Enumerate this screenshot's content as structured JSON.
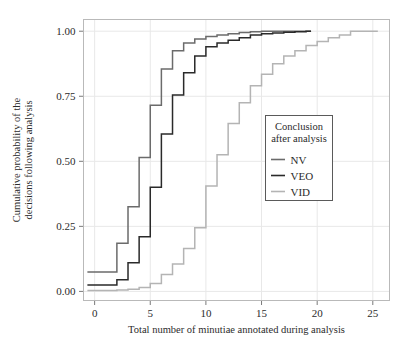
{
  "figure": {
    "name": "cumulative-probability-ecdf-chart",
    "background": "#ffffff"
  },
  "chart_data": {
    "type": "line",
    "subtype": "step-ecdf",
    "title": "",
    "xlabel": "Total number of minutiae annotated during analysis",
    "ylabel": "Cumulative probability of the decisions following analysis",
    "ylabel_line1": "Cumulative probability of the",
    "ylabel_line2": "decisions following analysis",
    "xlim": [
      -1,
      26.5
    ],
    "ylim": [
      -0.035,
      1.045
    ],
    "xticks": [
      0,
      5,
      10,
      15,
      20,
      25
    ],
    "xticklabels": [
      "0",
      "5",
      "10",
      "15",
      "20",
      "25"
    ],
    "yticks": [
      0.0,
      0.25,
      0.5,
      0.75,
      1.0
    ],
    "yticklabels": [
      "0.00",
      "0.25",
      "0.50",
      "0.75",
      "1.00"
    ],
    "grid": true,
    "grid_color": "#e8e8e8",
    "panel_border_color": "#b9b9b9",
    "legend": {
      "title_line1": "Conclusion",
      "title_line2": "after analysis",
      "position": "inside-right-middle",
      "entries": [
        {
          "label": "NV",
          "color": "#6b6b6b"
        },
        {
          "label": "VEO",
          "color": "#2a2a2a"
        },
        {
          "label": "VID",
          "color": "#b4b4b4"
        }
      ]
    },
    "series": [
      {
        "name": "NV",
        "color": "#6b6b6b",
        "x": [
          1,
          2,
          3,
          4,
          5,
          6,
          7,
          8,
          9,
          10,
          11,
          12,
          13,
          14,
          15,
          19
        ],
        "y": [
          0.075,
          0.185,
          0.325,
          0.515,
          0.715,
          0.855,
          0.925,
          0.955,
          0.97,
          0.98,
          0.985,
          0.99,
          0.995,
          0.998,
          1.0,
          1.0
        ]
      },
      {
        "name": "VEO",
        "color": "#2a2a2a",
        "x": [
          1,
          2,
          3,
          4,
          5,
          6,
          7,
          8,
          9,
          10,
          11,
          12,
          13,
          14,
          15,
          16,
          17,
          18,
          19
        ],
        "y": [
          0.025,
          0.045,
          0.11,
          0.21,
          0.4,
          0.605,
          0.755,
          0.84,
          0.905,
          0.94,
          0.955,
          0.965,
          0.975,
          0.985,
          0.99,
          0.993,
          0.996,
          0.998,
          1.0
        ]
      },
      {
        "name": "VID",
        "color": "#b4b4b4",
        "x": [
          1,
          2,
          3,
          4,
          5,
          6,
          7,
          8,
          9,
          10,
          11,
          12,
          13,
          14,
          15,
          16,
          17,
          18,
          19,
          20,
          21,
          22,
          23,
          25
        ],
        "y": [
          0.003,
          0.005,
          0.008,
          0.015,
          0.03,
          0.065,
          0.105,
          0.165,
          0.245,
          0.405,
          0.525,
          0.645,
          0.725,
          0.79,
          0.835,
          0.875,
          0.905,
          0.925,
          0.945,
          0.96,
          0.975,
          0.985,
          1.0,
          1.0
        ]
      }
    ]
  }
}
